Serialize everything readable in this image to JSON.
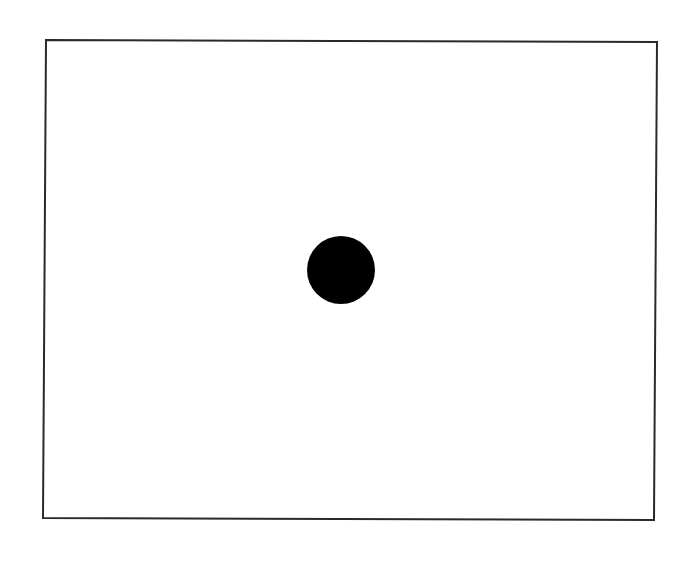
{
  "diagram": {
    "canvas": {
      "width": 690,
      "height": 561,
      "background": "#ffffff"
    },
    "frame": {
      "shape": "rectangle",
      "points": "46,40 657,42 654,520 43,518",
      "stroke": "#2a2a2a",
      "stroke_width": 2,
      "fill": "none"
    },
    "dot": {
      "shape": "circle",
      "cx": 341,
      "cy": 270,
      "r": 34,
      "fill": "#000000"
    }
  }
}
